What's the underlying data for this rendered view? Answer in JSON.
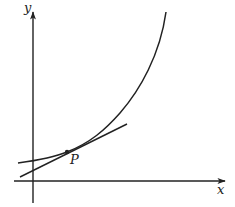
{
  "diagram": {
    "type": "function-graph-with-tangent",
    "axes": {
      "x_label": "x",
      "y_label": "y"
    },
    "curve": {
      "description": "increasing convex curve (exponential-like)"
    },
    "tangent": {
      "description": "tangent line to the curve at point P"
    },
    "point": {
      "label": "P"
    },
    "colors": {
      "stroke": "#222222",
      "background": "#ffffff"
    }
  }
}
